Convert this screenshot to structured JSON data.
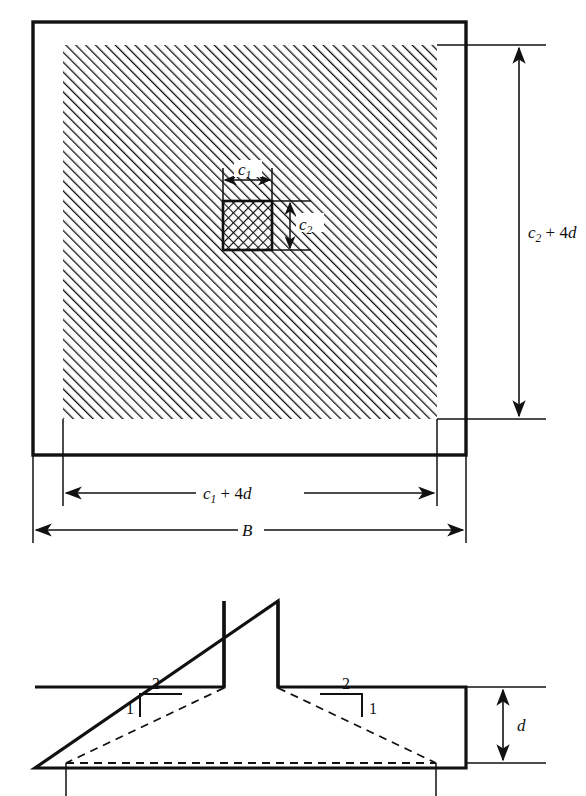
{
  "figure": {
    "title_fragment": "",
    "type": "engineering-diagram",
    "colors": {
      "line": "#111111",
      "background": "#ffffff",
      "hatch": "#111111"
    }
  },
  "plan_view": {
    "name": "plan-view",
    "outer_boundary_label": "B",
    "critical_section_label_horizontal": {
      "base": "c",
      "sub": "1",
      "operator": " + 4",
      "term": "d"
    },
    "critical_section_label_vertical": {
      "base": "c",
      "sub": "2",
      "operator": " + 4",
      "term": "d"
    },
    "column_width_label": {
      "base": "c",
      "sub": "1"
    },
    "column_depth_label": {
      "base": "c",
      "sub": "2"
    },
    "hatch": {
      "outer_pattern": "diagonal-45",
      "column_pattern": "cross-hatch"
    }
  },
  "elevation_view": {
    "name": "elevation-view",
    "depth_label": "d",
    "slope_left": {
      "rise": "1",
      "run": "2"
    },
    "slope_right": {
      "rise": "1",
      "run": "2"
    }
  }
}
